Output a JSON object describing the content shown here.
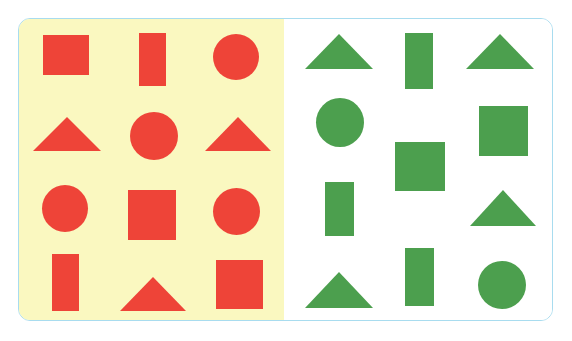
{
  "figure": {
    "card": {
      "border_color": "#a8dcef",
      "border_radius": 12,
      "x": 18,
      "y": 18,
      "width": 535,
      "height": 303
    },
    "panels": [
      {
        "name": "left-panel",
        "label": "Red shapes panel",
        "background_color": "#faf8c0",
        "shape_color": "#ee4438",
        "shape_count": 12,
        "x": 0,
        "width": 265
      },
      {
        "name": "right-panel",
        "label": "Green shapes panel",
        "background_color": "#ffffff",
        "shape_color": "#4c9f4e",
        "shape_count": 12,
        "x": 265,
        "width": 268
      }
    ]
  },
  "left_shapes": [
    {
      "name": "red-square-1",
      "kind": "square",
      "x": 24,
      "y": 16,
      "w": 46,
      "h": 40
    },
    {
      "name": "red-rect-1",
      "kind": "rect",
      "x": 120,
      "y": 14,
      "w": 27,
      "h": 53
    },
    {
      "name": "red-circle-1",
      "kind": "circle",
      "x": 194,
      "y": 15,
      "w": 46,
      "h": 46
    },
    {
      "name": "red-triangle-1",
      "kind": "triangle",
      "x": 14,
      "y": 98,
      "w": 68,
      "h": 34
    },
    {
      "name": "red-circle-2",
      "kind": "circle",
      "x": 111,
      "y": 93,
      "w": 48,
      "h": 48
    },
    {
      "name": "red-triangle-2",
      "kind": "triangle",
      "x": 186,
      "y": 98,
      "w": 66,
      "h": 34
    },
    {
      "name": "red-circle-3",
      "kind": "circle",
      "x": 23,
      "y": 166,
      "w": 46,
      "h": 47
    },
    {
      "name": "red-square-2",
      "kind": "square",
      "x": 109,
      "y": 171,
      "w": 48,
      "h": 50
    },
    {
      "name": "red-circle-4",
      "kind": "circle",
      "x": 194,
      "y": 169,
      "w": 47,
      "h": 47
    },
    {
      "name": "red-rect-2",
      "kind": "rect",
      "x": 33,
      "y": 235,
      "w": 27,
      "h": 57
    },
    {
      "name": "red-triangle-3",
      "kind": "triangle",
      "x": 101,
      "y": 258,
      "w": 66,
      "h": 34
    },
    {
      "name": "red-square-3",
      "kind": "square",
      "x": 197,
      "y": 241,
      "w": 47,
      "h": 49
    }
  ],
  "right_shapes": [
    {
      "name": "green-triangle-1",
      "kind": "triangle",
      "x": 21,
      "y": 15,
      "w": 68,
      "h": 35
    },
    {
      "name": "green-rect-1",
      "kind": "rect",
      "x": 121,
      "y": 14,
      "w": 28,
      "h": 56
    },
    {
      "name": "green-triangle-2",
      "kind": "triangle",
      "x": 182,
      "y": 15,
      "w": 68,
      "h": 35
    },
    {
      "name": "green-circle-1",
      "kind": "circle",
      "x": 32,
      "y": 79,
      "w": 48,
      "h": 49
    },
    {
      "name": "green-square-1",
      "kind": "square",
      "x": 111,
      "y": 123,
      "w": 50,
      "h": 49
    },
    {
      "name": "green-square-2",
      "kind": "square",
      "x": 195,
      "y": 87,
      "w": 49,
      "h": 50
    },
    {
      "name": "green-rect-2",
      "kind": "rect",
      "x": 41,
      "y": 163,
      "w": 29,
      "h": 54
    },
    {
      "name": "green-triangle-3",
      "kind": "triangle",
      "x": 186,
      "y": 171,
      "w": 66,
      "h": 36
    },
    {
      "name": "green-triangle-4",
      "kind": "triangle",
      "x": 21,
      "y": 253,
      "w": 68,
      "h": 36
    },
    {
      "name": "green-rect-3",
      "kind": "rect",
      "x": 121,
      "y": 229,
      "w": 29,
      "h": 58
    },
    {
      "name": "green-circle-2",
      "kind": "circle",
      "x": 194,
      "y": 242,
      "w": 48,
      "h": 48
    }
  ],
  "colors": {
    "red": "#ee4438",
    "green": "#4c9f4e",
    "yellow_bg": "#faf8c0",
    "white_bg": "#ffffff",
    "card_border": "#a8dcef",
    "page_bg": "#ffffff"
  }
}
